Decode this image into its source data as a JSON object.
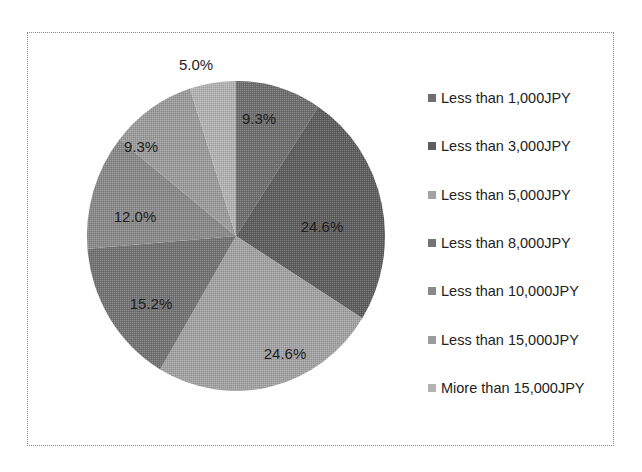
{
  "chart_data": {
    "type": "pie",
    "title": "",
    "start_angle_deg": 0,
    "direction": "clockwise",
    "categories": [
      "Less than 1,000JPY",
      "Less than 3,000JPY",
      "Less than 5,000JPY",
      "Less than 8,000JPY",
      "Less than 10,000JPY",
      "Less than 15,000JPY",
      "Miore than 15,000JPY"
    ],
    "values": [
      9.3,
      24.6,
      24.6,
      15.2,
      12.0,
      9.3,
      5.0
    ],
    "labels": [
      "9.3%",
      "24.6%",
      "24.6%",
      "15.2%",
      "12.0%",
      "9.3%",
      "5.0%"
    ],
    "colors": [
      "#6f6f6f",
      "#5e5e5e",
      "#a3a3a3",
      "#747474",
      "#8a8a8a",
      "#9c9c9c",
      "#b3b3b3"
    ],
    "legend_position": "right",
    "label_positions": [
      {
        "x": 259,
        "y": 120
      },
      {
        "x": 322,
        "y": 228
      },
      {
        "x": 285,
        "y": 355
      },
      {
        "x": 151,
        "y": 305
      },
      {
        "x": 135,
        "y": 218
      },
      {
        "x": 141,
        "y": 148
      },
      {
        "x": 196,
        "y": 66
      }
    ]
  },
  "legend": {
    "items": [
      {
        "label": "Less than 1,000JPY",
        "color": "#6f6f6f"
      },
      {
        "label": "Less than 3,000JPY",
        "color": "#5e5e5e"
      },
      {
        "label": "Less than 5,000JPY",
        "color": "#a3a3a3"
      },
      {
        "label": "Less than 8,000JPY",
        "color": "#747474"
      },
      {
        "label": "Less than 10,000JPY",
        "color": "#8a8a8a"
      },
      {
        "label": "Less than 15,000JPY",
        "color": "#9c9c9c"
      },
      {
        "label": "Miore than 15,000JPY",
        "color": "#b3b3b3"
      }
    ]
  }
}
